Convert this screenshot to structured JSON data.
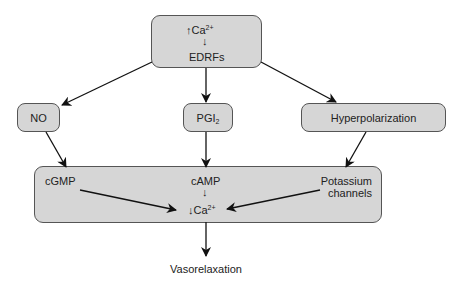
{
  "diagram": {
    "title": "",
    "nodes": {
      "top": {
        "line1_arrow": "↑",
        "line1_text": "Ca",
        "line1_sup": "2+",
        "mid_arrow": "↓",
        "line2_text": "EDRFs"
      },
      "no": {
        "label": "NO"
      },
      "pgi2": {
        "label": "PGI",
        "sub": "2"
      },
      "hyper": {
        "label": "Hyperpolarization"
      },
      "bottom": {
        "cgmp": "cGMP",
        "camp": "cAMP",
        "camp_arrow": "↓",
        "ca_arrow": "↓",
        "ca_text": "Ca",
        "ca_sup": "2+",
        "potassium_line1": "Potassium",
        "potassium_line2": "channels"
      },
      "outcome": {
        "label": "Vasorelaxation"
      }
    },
    "edges": [
      {
        "from": "top",
        "to": "no"
      },
      {
        "from": "top",
        "to": "pgi2"
      },
      {
        "from": "top",
        "to": "hyper"
      },
      {
        "from": "no",
        "to": "bottom"
      },
      {
        "from": "pgi2",
        "to": "bottom"
      },
      {
        "from": "hyper",
        "to": "bottom"
      },
      {
        "from": "cgmp",
        "to": "ca"
      },
      {
        "from": "potassium",
        "to": "ca"
      },
      {
        "from": "bottom",
        "to": "outcome"
      }
    ],
    "colors": {
      "box_fill": "#d6d6d6",
      "box_border": "#555555",
      "line": "#111111"
    }
  }
}
